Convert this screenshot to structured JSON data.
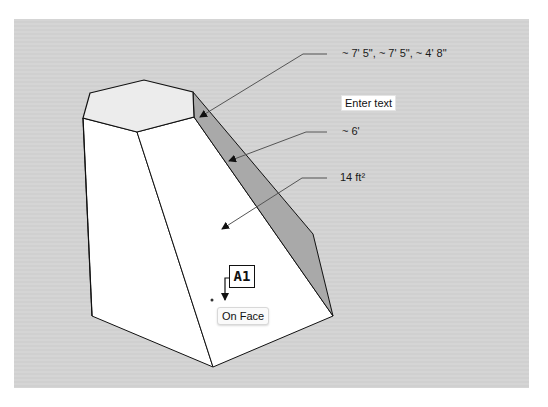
{
  "viewport": {
    "background": "#d3d3d3",
    "face_colors": {
      "front": "#ffffff",
      "top": "#ececec",
      "side": "#a9a9a9"
    }
  },
  "dimensions": [
    {
      "label": "~ 7' 5\", ~ 7' 5\", ~ 4' 8\"",
      "target": "top-edge"
    },
    {
      "label": "~ 6'",
      "target": "side-edge"
    },
    {
      "label": "14 ft²",
      "target": "front-face"
    }
  ],
  "text_input": {
    "placeholder": "Enter text"
  },
  "cursor": {
    "tool_label": "A1",
    "inference_tooltip": "On Face"
  }
}
